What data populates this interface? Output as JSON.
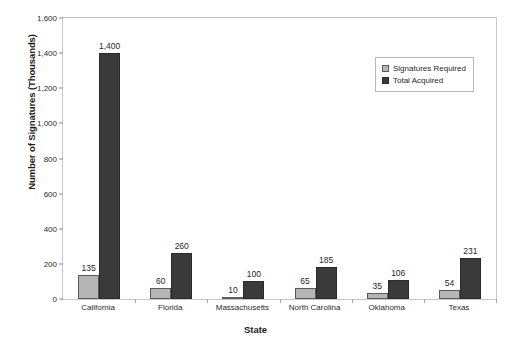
{
  "chart_data": {
    "type": "bar",
    "title": "",
    "xlabel": "State",
    "ylabel": "Number of Signatures (Thousands)",
    "categories": [
      "California",
      "Florida",
      "Massachusetts",
      "North Carolina",
      "Oklahoma",
      "Texas"
    ],
    "series": [
      {
        "name": "Signatures Required",
        "color": "#b5b5b5",
        "values": [
          135,
          60,
          10,
          65,
          35,
          54
        ],
        "labels": [
          "135",
          "60",
          "10",
          "65",
          "35",
          "54"
        ]
      },
      {
        "name": "Total Acquired",
        "color": "#3a3a3a",
        "values": [
          1400,
          260,
          100,
          185,
          106,
          231
        ],
        "labels": [
          "1,400",
          "260",
          "100",
          "185",
          "106",
          "231"
        ]
      }
    ],
    "ylim": [
      0,
      1600
    ],
    "ytick_values": [
      0,
      200,
      400,
      600,
      800,
      1000,
      1200,
      1400,
      1600
    ],
    "ytick_labels": [
      "0",
      "200",
      "400",
      "600",
      "800",
      "1,000",
      "1,200",
      "1,400",
      "1,600"
    ],
    "grid": false,
    "legend_position": "top-right",
    "legend_entries": [
      "Signatures Required",
      "Total Acquired"
    ]
  }
}
